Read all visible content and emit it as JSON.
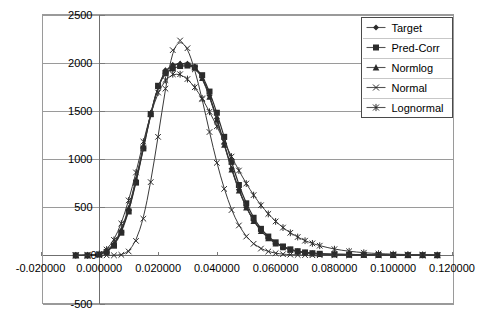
{
  "chart_data": {
    "type": "line",
    "title": "",
    "subtitle": "",
    "xlabel": "",
    "ylabel": "",
    "xlim": [
      -0.02,
      0.12
    ],
    "ylim": [
      -500,
      2500
    ],
    "grid": true,
    "grid_axis": "y",
    "legend_position": "top-right",
    "x_ticks": [
      "-0.020000",
      "0.000000",
      "0.020000",
      "0.040000",
      "0.060000",
      "0.080000",
      "0.100000",
      "0.120000"
    ],
    "x_tick_values": [
      -0.02,
      0.0,
      0.02,
      0.04,
      0.06,
      0.08,
      0.1,
      0.12
    ],
    "y_ticks": [
      "-500",
      "0",
      "500",
      "1000",
      "1500",
      "2000",
      "2500"
    ],
    "y_tick_values": [
      -500,
      0,
      500,
      1000,
      1500,
      2000,
      2500
    ],
    "y_tick_labels_shown": [
      "2500",
      "2000",
      "1500",
      "1000",
      "500",
      "-500"
    ],
    "x": [
      -0.008,
      -0.004,
      0.0,
      0.0025,
      0.005,
      0.0075,
      0.01,
      0.0125,
      0.015,
      0.0175,
      0.02,
      0.0225,
      0.025,
      0.0275,
      0.03,
      0.0325,
      0.035,
      0.0375,
      0.04,
      0.0425,
      0.045,
      0.0475,
      0.05,
      0.0525,
      0.055,
      0.0575,
      0.06,
      0.0625,
      0.065,
      0.0675,
      0.07,
      0.0725,
      0.075,
      0.08,
      0.085,
      0.09,
      0.095,
      0.1,
      0.105,
      0.11,
      0.115
    ],
    "series": [
      {
        "name": "Target",
        "marker": "diamond",
        "values": [
          0,
          0,
          10,
          40,
          110,
          250,
          470,
          770,
          1120,
          1470,
          1750,
          1920,
          1975,
          1990,
          1990,
          1960,
          1850,
          1660,
          1420,
          1160,
          900,
          680,
          500,
          360,
          255,
          180,
          125,
          85,
          58,
          40,
          28,
          20,
          15,
          10,
          7,
          5,
          4,
          3,
          2,
          2,
          1
        ]
      },
      {
        "name": "Pred-Corr",
        "marker": "square",
        "values": [
          0,
          0,
          8,
          35,
          100,
          235,
          455,
          755,
          1110,
          1465,
          1760,
          1890,
          1940,
          1965,
          1970,
          1950,
          1870,
          1700,
          1480,
          1230,
          970,
          730,
          540,
          390,
          275,
          195,
          135,
          92,
          62,
          43,
          30,
          22,
          16,
          11,
          8,
          6,
          4,
          3,
          2,
          2,
          1
        ]
      },
      {
        "name": "Normlog",
        "marker": "triangle",
        "values": [
          0,
          0,
          12,
          45,
          120,
          265,
          490,
          790,
          1135,
          1480,
          1755,
          1915,
          1972,
          1988,
          1985,
          1950,
          1840,
          1645,
          1405,
          1145,
          890,
          670,
          495,
          355,
          250,
          176,
          122,
          83,
          56,
          39,
          27,
          19,
          14,
          10,
          7,
          5,
          4,
          3,
          2,
          2,
          1
        ]
      },
      {
        "name": "Normal",
        "marker": "cross",
        "values": [
          0,
          0,
          0,
          0,
          0,
          5,
          40,
          150,
          380,
          760,
          1230,
          1730,
          2130,
          2230,
          2150,
          1930,
          1620,
          1280,
          960,
          690,
          470,
          310,
          195,
          120,
          70,
          40,
          22,
          12,
          7,
          4,
          2,
          1,
          1,
          0,
          0,
          0,
          0,
          0,
          0,
          0,
          0
        ]
      },
      {
        "name": "Lognormal",
        "marker": "star",
        "values": [
          0,
          0,
          15,
          60,
          160,
          330,
          570,
          860,
          1180,
          1470,
          1690,
          1820,
          1880,
          1880,
          1830,
          1745,
          1630,
          1490,
          1340,
          1180,
          1025,
          880,
          745,
          625,
          520,
          430,
          352,
          288,
          234,
          190,
          152,
          124,
          100,
          64,
          42,
          27,
          18,
          12,
          8,
          5,
          3
        ]
      }
    ],
    "legend_entries": [
      {
        "label": "Target",
        "marker": "diamond"
      },
      {
        "label": "Pred-Corr",
        "marker": "square"
      },
      {
        "label": "Normlog",
        "marker": "triangle"
      },
      {
        "label": "Normal",
        "marker": "cross"
      },
      {
        "label": "Lognormal",
        "marker": "star"
      }
    ],
    "colors": {
      "series": "#2b2b2b",
      "grid": "#9a9a9a",
      "frame": "#9a9a9a",
      "background": "#ffffff",
      "text": "#000000"
    }
  }
}
